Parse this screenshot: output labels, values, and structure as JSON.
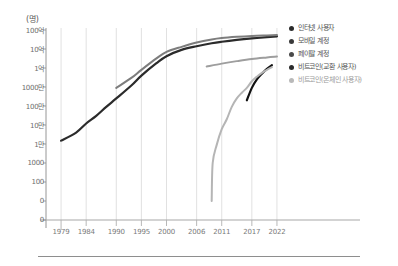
{
  "chart_data": {
    "type": "line",
    "title": "",
    "subtitle": "",
    "xlabel": "",
    "ylabel": "(명)",
    "y_unit_label": "(명)",
    "grid": "vertical",
    "y_scale": "log",
    "legend_position": "right",
    "x": [
      1979,
      1984,
      1990,
      1995,
      2000,
      2006,
      2011,
      2017,
      2022
    ],
    "xtick_labels": [
      "1979",
      "1984",
      "1990",
      "1995",
      "2000",
      "2006",
      "2011",
      "2017",
      "2022"
    ],
    "ytick_labels": [
      "100억",
      "10억",
      "1억",
      "1000만",
      "100만",
      "10만",
      "1만",
      "1000",
      "100",
      "0",
      "0"
    ],
    "ytick_values": [
      10000000000,
      1000000000,
      100000000,
      10000000,
      1000000,
      100000,
      10000,
      1000,
      100,
      0,
      0
    ],
    "xlim": [
      1976,
      2024
    ],
    "ylim_log": [
      1000,
      10000000000
    ],
    "series": [
      {
        "name": "인터넷 사용자",
        "color": "#2b2b2b",
        "width": 2.2,
        "points": [
          [
            1979,
            15000
          ],
          [
            1982,
            40000
          ],
          [
            1984,
            120000
          ],
          [
            1986,
            300000
          ],
          [
            1988,
            900000
          ],
          [
            1990,
            2500000
          ],
          [
            1993,
            12000000
          ],
          [
            1995,
            40000000
          ],
          [
            1998,
            180000000
          ],
          [
            2000,
            420000000
          ],
          [
            2003,
            900000000
          ],
          [
            2006,
            1400000000
          ],
          [
            2009,
            2000000000
          ],
          [
            2011,
            2400000000
          ],
          [
            2014,
            3000000000
          ],
          [
            2017,
            3600000000
          ],
          [
            2020,
            4200000000
          ],
          [
            2022,
            4600000000
          ]
        ]
      },
      {
        "name": "모바일 계정",
        "color": "#7d7d7d",
        "width": 2.0,
        "points": [
          [
            1990,
            9000000
          ],
          [
            1993,
            30000000
          ],
          [
            1995,
            80000000
          ],
          [
            1998,
            320000000
          ],
          [
            2000,
            700000000
          ],
          [
            2003,
            1300000000
          ],
          [
            2006,
            2200000000
          ],
          [
            2009,
            3200000000
          ],
          [
            2011,
            3800000000
          ],
          [
            2014,
            4400000000
          ],
          [
            2017,
            4900000000
          ],
          [
            2020,
            5200000000
          ],
          [
            2022,
            5400000000
          ]
        ]
      },
      {
        "name": "페이팔 계정",
        "color": "#9e9e9e",
        "width": 2.0,
        "points": [
          [
            2008,
            120000000
          ],
          [
            2011,
            170000000
          ],
          [
            2014,
            230000000
          ],
          [
            2017,
            300000000
          ],
          [
            2020,
            360000000
          ],
          [
            2022,
            400000000
          ]
        ]
      },
      {
        "name": "비트코인(교환 사용자)",
        "color": "#111111",
        "width": 2.2,
        "points": [
          [
            2016,
            2000000
          ],
          [
            2017,
            9000000
          ],
          [
            2018,
            25000000
          ],
          [
            2019,
            50000000
          ],
          [
            2020,
            90000000
          ],
          [
            2021,
            140000000
          ]
        ]
      },
      {
        "name": "비트코인(온체인 사용자)",
        "color": "#b5b5b5",
        "width": 2.0,
        "points": [
          [
            2009,
            10
          ],
          [
            2009.2,
            1000
          ],
          [
            2010,
            9000
          ],
          [
            2011,
            60000
          ],
          [
            2012,
            200000
          ],
          [
            2013,
            900000
          ],
          [
            2014,
            2500000
          ],
          [
            2015,
            5000000
          ],
          [
            2016,
            9000000
          ],
          [
            2017,
            20000000
          ],
          [
            2018,
            35000000
          ],
          [
            2019,
            55000000
          ],
          [
            2020,
            80000000
          ],
          [
            2021,
            110000000
          ]
        ]
      }
    ]
  },
  "legend": {
    "items": [
      {
        "label": "인터넷 사용자",
        "color": "#2b2b2b"
      },
      {
        "label": "모바일 계정",
        "color": "#3a3a3a"
      },
      {
        "label": "페이팔 계정",
        "color": "#4a4a4a"
      },
      {
        "label": "비트코인(교환 사용자)",
        "color": "#2b2b2b"
      },
      {
        "label": "비트코인(온체인 사용자)",
        "color": "#b9b9b9"
      }
    ]
  },
  "axes": {
    "y_title": "(명)",
    "axis_color": "#8a8a8a",
    "grid_color": "#d9d9d9"
  }
}
